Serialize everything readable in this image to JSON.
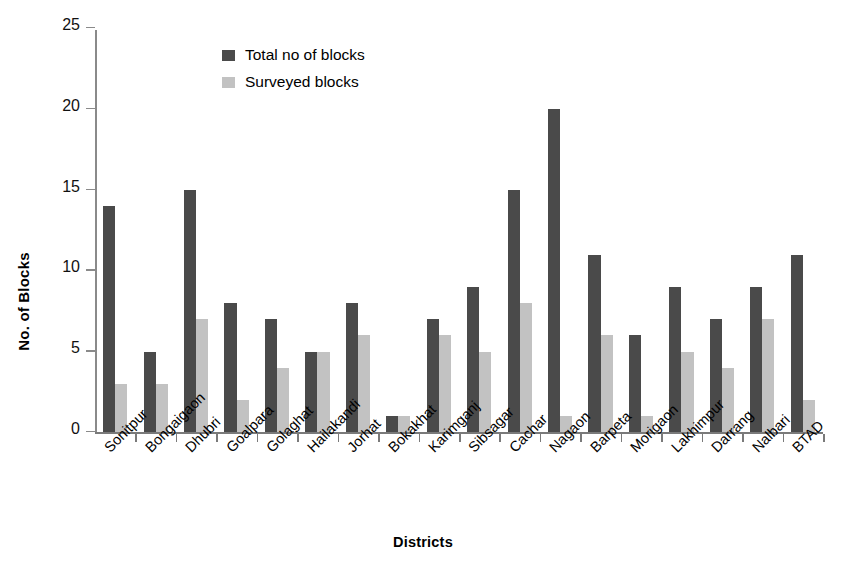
{
  "chart_data": {
    "type": "bar",
    "title": "",
    "xlabel": "Districts",
    "ylabel": "No. of Blocks",
    "ylim": [
      0,
      25
    ],
    "ytick_values": [
      0,
      5,
      10,
      15,
      20,
      25
    ],
    "ytick_labels": [
      "0",
      "5",
      "10",
      "15",
      "20",
      "25"
    ],
    "grid": false,
    "legend_position": "top-center-left",
    "categories": [
      "Sonitpur",
      "Bongaigaon",
      "Dhubri",
      "Goalpara",
      "Golaghat",
      "Hailakandi",
      "Jorhat",
      "Bokakhat",
      "Karimganj",
      "Sibsagar",
      "Cachar",
      "Nagaon",
      "Barpeta",
      "Morigaon",
      "Lakhimpur",
      "Darrang",
      "Nalbari",
      "BTAD"
    ],
    "series": [
      {
        "name": "Total no of blocks",
        "color": "#4a4a4a",
        "values": [
          14,
          5,
          15,
          8,
          7,
          5,
          8,
          1,
          7,
          9,
          15,
          20,
          11,
          6,
          9,
          7,
          9,
          11
        ]
      },
      {
        "name": "Surveyed blocks",
        "color": "#c2c2c2",
        "values": [
          3,
          3,
          7,
          2,
          4,
          5,
          6,
          1,
          6,
          5,
          8,
          1,
          6,
          1,
          5,
          4,
          7,
          2
        ]
      }
    ]
  },
  "legend": {
    "items": [
      {
        "label": "Total no of blocks",
        "swatch_class": "total"
      },
      {
        "label": "Surveyed blocks",
        "swatch_class": "surveyed"
      }
    ]
  },
  "axes": {
    "y_title": "No. of Blocks",
    "x_title": "Districts"
  },
  "caption": {
    "remnant": ""
  }
}
